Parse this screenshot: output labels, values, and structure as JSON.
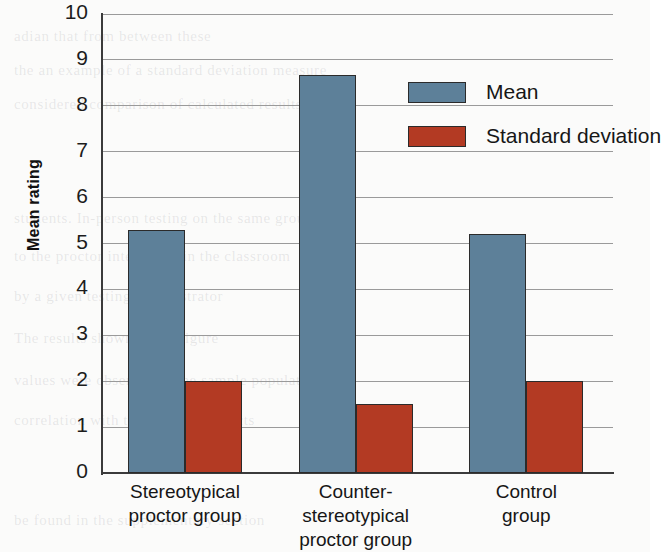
{
  "chart_data": {
    "type": "bar",
    "title": "",
    "xlabel": "",
    "ylabel": "Mean rating",
    "ylim": [
      0,
      10
    ],
    "yticks": [
      "0",
      "1",
      "2",
      "3",
      "4",
      "5",
      "6",
      "7",
      "8",
      "9",
      "10"
    ],
    "grid": true,
    "legend_position": "upper right",
    "categories": [
      "Stereotypical\nproctor group",
      "Counter-\nstereotypical\nproctor group",
      "Control\ngroup"
    ],
    "category_lines": [
      [
        "Stereotypical",
        "proctor group"
      ],
      [
        "Counter-",
        "stereotypical",
        "proctor group"
      ],
      [
        "Control",
        "group"
      ]
    ],
    "series": [
      {
        "name": "Mean",
        "color": "#5d8099",
        "values": [
          5.3,
          8.67,
          5.2
        ]
      },
      {
        "name": "Standard deviation",
        "color": "#b33a23",
        "values": [
          2.0,
          1.5,
          2.0
        ]
      }
    ]
  },
  "legend": {
    "items": [
      {
        "label": "Mean",
        "color": "#5d8099"
      },
      {
        "label": "Standard deviation",
        "color": "#b33a23"
      }
    ]
  },
  "axes": {
    "y_title": "Mean rating"
  },
  "background_text": {
    "lines": [
      "adian that from between these",
      "the an example of a standard deviation measure",
      "considered comparison of calculated results",
      "students. In-person testing on the same group",
      "to the proctor interaction in the classroom",
      "by a given testing administrator",
      "The results shown in the figure",
      "values were observed in the sample population",
      "correlation with the observed effects",
      "be found in the supplementary section"
    ]
  }
}
